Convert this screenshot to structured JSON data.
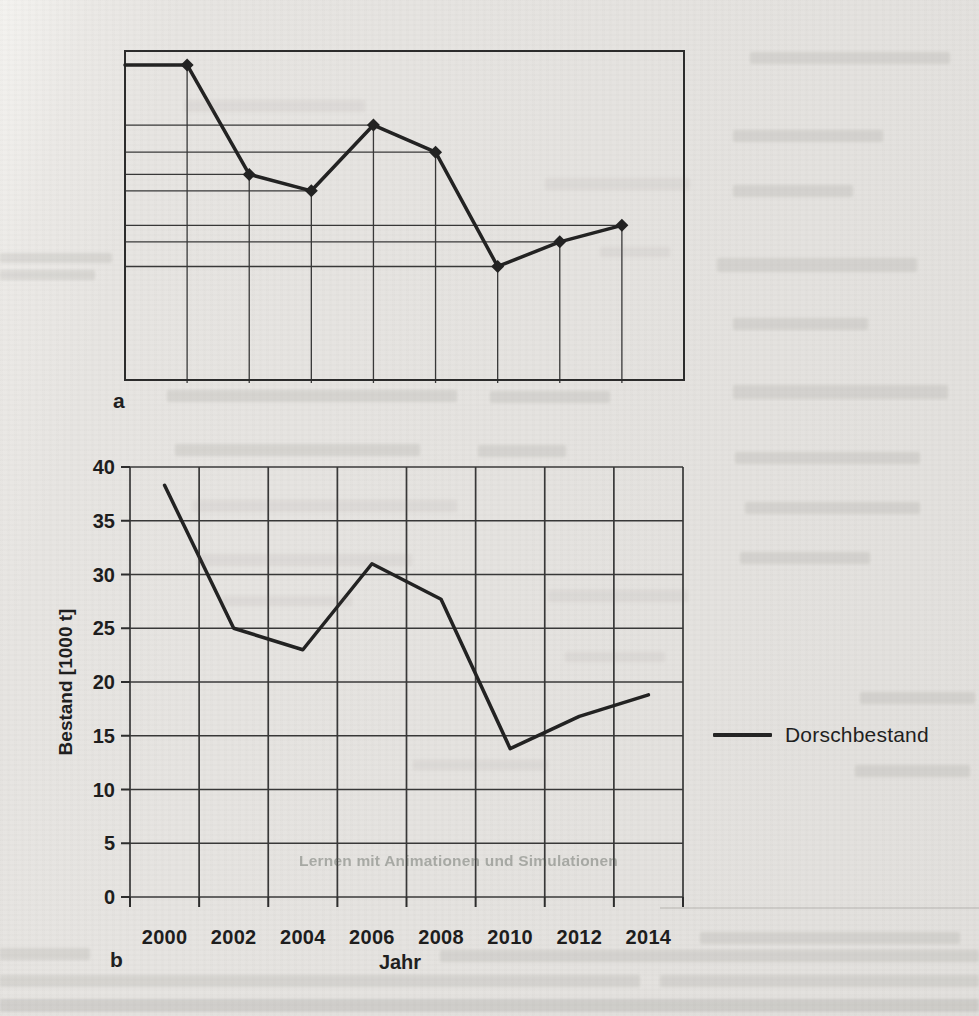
{
  "figure": {
    "panel_a": {
      "label": "a"
    },
    "panel_b": {
      "label": "b",
      "x_axis_title": "Jahr",
      "y_axis_title": "Bestand [1000 t]",
      "legend_label": "Dorschbestand"
    },
    "colors": {
      "ink": "#222222",
      "grid": "#383838",
      "paper": "#e7e5e2"
    }
  },
  "ghost_text": {
    "section_heading": "Lernen mit Animationen und Simulationen"
  },
  "chart_data": [
    {
      "panel": "a",
      "type": "line",
      "title": "",
      "categories": [
        "2000",
        "2002",
        "2004",
        "2006",
        "2008",
        "2010",
        "2012",
        "2014"
      ],
      "values": [
        38.3,
        25,
        23,
        31,
        27.7,
        13.8,
        16.8,
        18.8
      ],
      "series_name": "Dorschbestand",
      "xlabel": "",
      "ylabel": "",
      "ylim": [
        0,
        40
      ],
      "tick_labels_visible": false,
      "marker": "diamond",
      "drop_lines_to_both_axes": true,
      "line_starts_at_y_axis": true,
      "grid": false,
      "legend_position": "none"
    },
    {
      "panel": "b",
      "type": "line",
      "title": "",
      "categories": [
        "2000",
        "2002",
        "2004",
        "2006",
        "2008",
        "2010",
        "2012",
        "2014"
      ],
      "values": [
        38.3,
        25,
        23,
        31,
        27.7,
        13.8,
        16.8,
        18.8
      ],
      "series_name": "Dorschbestand",
      "xlabel": "Jahr",
      "ylabel": "Bestand [1000 t]",
      "ylim": [
        0,
        40
      ],
      "yticks": [
        0,
        5,
        10,
        15,
        20,
        25,
        30,
        35,
        40
      ],
      "tick_labels_visible": true,
      "marker": "none",
      "grid": true,
      "legend_position": "right"
    }
  ]
}
